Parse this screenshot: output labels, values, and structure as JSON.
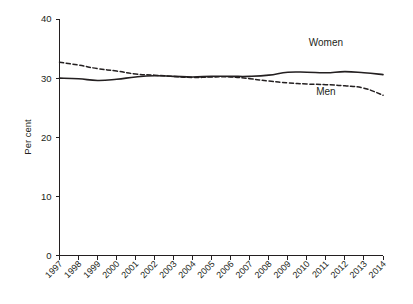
{
  "chart_data": {
    "type": "line",
    "title": "",
    "subtitle": "",
    "xlabel": "",
    "ylabel": "Per cent",
    "ylim": [
      0,
      40
    ],
    "yticks": [
      0,
      10,
      20,
      30,
      40
    ],
    "ytick_labels": [
      "0",
      "10",
      "20",
      "30",
      "40"
    ],
    "grid": false,
    "legend_position": "inline-annotation",
    "categories": [
      "1997",
      "1998",
      "1999",
      "2000",
      "2001",
      "2002",
      "2003",
      "2004",
      "2005",
      "2006",
      "2007",
      "2008",
      "2009",
      "2010",
      "2011",
      "2012",
      "2013",
      "2014"
    ],
    "x": [
      1997,
      1998,
      1999,
      2000,
      2001,
      2002,
      2003,
      2004,
      2005,
      2006,
      2007,
      2008,
      2009,
      2010,
      2011,
      2012,
      2013,
      2014
    ],
    "series": [
      {
        "name": "Women",
        "style": "solid",
        "color": "#231f20",
        "label_x": 2011,
        "label_y": 35.4,
        "values": [
          30.0,
          29.9,
          29.6,
          29.8,
          30.2,
          30.4,
          30.3,
          30.2,
          30.3,
          30.3,
          30.3,
          30.5,
          31.0,
          31.0,
          30.9,
          31.1,
          30.9,
          30.6
        ]
      },
      {
        "name": "Men",
        "style": "dashed",
        "color": "#231f20",
        "label_x": 2011,
        "label_y": 27.2,
        "values": [
          32.7,
          32.2,
          31.6,
          31.2,
          30.7,
          30.5,
          30.3,
          30.1,
          30.2,
          30.2,
          29.9,
          29.5,
          29.2,
          29.0,
          28.9,
          28.7,
          28.3,
          27.1
        ]
      }
    ],
    "annotations": [
      {
        "text": "Women",
        "x": 2011,
        "y": 35.4
      },
      {
        "text": "Men",
        "x": 2011,
        "y": 27.2
      }
    ]
  }
}
